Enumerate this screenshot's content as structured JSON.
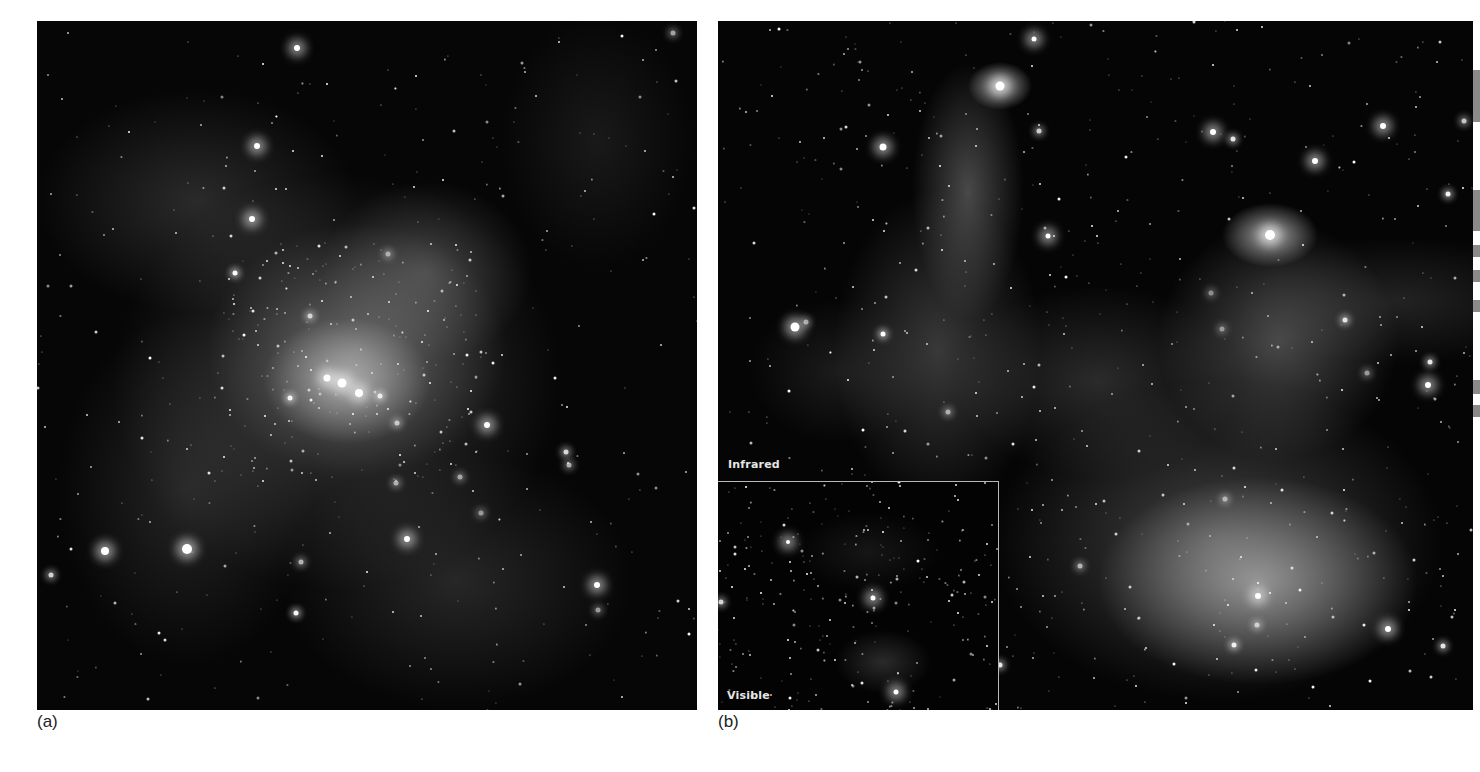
{
  "figure": {
    "panels": [
      {
        "id": "a",
        "caption": "(a)",
        "description": "Star-forming region with dense cluster of bright stars embedded in diffuse grey nebulosity"
      },
      {
        "id": "b",
        "caption": "(b)",
        "description": "Infrared view of gas pillars with bright stars at their tips and a bright glowing cloud at lower right",
        "overlay_labels": {
          "main": "Infrared",
          "inset": "Visible"
        }
      }
    ],
    "colors": {
      "background": "#ffffff",
      "sky": "#050505",
      "inset_border": "#b8b8b8",
      "label_text": "#e6e6e6",
      "caption_text": "#222222"
    }
  }
}
